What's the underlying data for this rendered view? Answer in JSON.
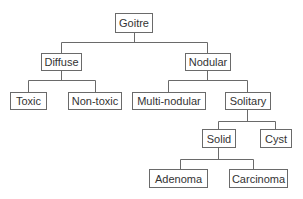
{
  "diagram": {
    "type": "tree",
    "line_color": "#6a6a6a",
    "nodes": {
      "goitre": "Goitre",
      "diffuse": "Diffuse",
      "nodular": "Nodular",
      "toxic": "Toxic",
      "non_toxic": "Non-toxic",
      "multi_nodular": "Multi-nodular",
      "solitary": "Solitary",
      "solid": "Solid",
      "cyst": "Cyst",
      "adenoma": "Adenoma",
      "carcinoma": "Carcinoma"
    },
    "edges": [
      [
        "Goitre",
        "Diffuse"
      ],
      [
        "Goitre",
        "Nodular"
      ],
      [
        "Diffuse",
        "Toxic"
      ],
      [
        "Diffuse",
        "Non-toxic"
      ],
      [
        "Nodular",
        "Multi-nodular"
      ],
      [
        "Nodular",
        "Solitary"
      ],
      [
        "Solitary",
        "Solid"
      ],
      [
        "Solitary",
        "Cyst"
      ],
      [
        "Solid",
        "Adenoma"
      ],
      [
        "Solid",
        "Carcinoma"
      ]
    ]
  }
}
